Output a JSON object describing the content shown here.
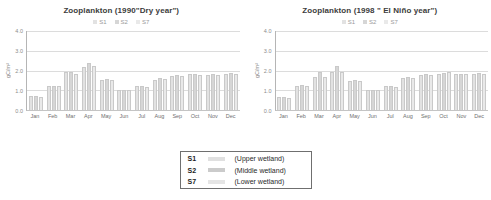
{
  "colors": {
    "grid": "#dcdcdc",
    "axis_line": "#b5b5b5",
    "baseline": "#c4c4c4",
    "title_text": "#3c3c3c",
    "axis_text": "#8c8c8c",
    "legend_text": "#9a9a9a",
    "bar_border": "#c9c9c9"
  },
  "chart_data": [
    {
      "type": "bar",
      "title": "Zooplankton (1990\"Dry year\")",
      "ylabel": "gC/m²",
      "ylim": [
        0.0,
        4.0
      ],
      "yticks": [
        "4.0",
        "3.0",
        "2.0",
        "1.0",
        "0.0"
      ],
      "grid": true,
      "legend_position": "top",
      "legend": [
        "S1",
        "S2",
        "S7"
      ],
      "categories": [
        "Jan",
        "Feb",
        "Mar",
        "Apr",
        "May",
        "Jun",
        "Jul",
        "Aug",
        "Sep",
        "Oct",
        "Nov",
        "Dec"
      ],
      "series": [
        {
          "name": "S1",
          "color": "#e2e2e2",
          "values": [
            0.7,
            1.2,
            1.9,
            2.2,
            1.5,
            1.0,
            1.2,
            1.5,
            1.7,
            1.8,
            1.75,
            1.8
          ]
        },
        {
          "name": "S2",
          "color": "#d6d6d6",
          "values": [
            0.7,
            1.2,
            1.9,
            2.4,
            1.55,
            1.0,
            1.2,
            1.6,
            1.75,
            1.8,
            1.8,
            1.85
          ]
        },
        {
          "name": "S7",
          "color": "#e9e9e9",
          "values": [
            0.65,
            1.2,
            1.8,
            2.25,
            1.5,
            1.0,
            1.15,
            1.55,
            1.7,
            1.75,
            1.75,
            1.8
          ]
        }
      ]
    },
    {
      "type": "bar",
      "title": "Zooplankton (1998 \" El Niño year\")",
      "ylabel": "gC/m²",
      "ylim": [
        0.0,
        4.0
      ],
      "yticks": [
        "4.0",
        "3.0",
        "2.0",
        "1.0",
        "0.0"
      ],
      "grid": true,
      "legend_position": "top",
      "legend": [
        "S1",
        "S2",
        "S7"
      ],
      "categories": [
        "Jan",
        "Feb",
        "Mar",
        "Apr",
        "May",
        "Jun",
        "Jul",
        "Aug",
        "Sep",
        "Oct",
        "Nov",
        "Dec"
      ],
      "series": [
        {
          "name": "S1",
          "color": "#e2e2e2",
          "values": [
            0.65,
            1.2,
            1.65,
            1.9,
            1.45,
            1.0,
            1.2,
            1.6,
            1.75,
            1.8,
            1.8,
            1.8
          ]
        },
        {
          "name": "S2",
          "color": "#d6d6d6",
          "values": [
            0.65,
            1.25,
            1.9,
            2.25,
            1.5,
            1.0,
            1.2,
            1.65,
            1.8,
            1.85,
            1.8,
            1.85
          ]
        },
        {
          "name": "S7",
          "color": "#e9e9e9",
          "values": [
            0.6,
            1.2,
            1.65,
            1.9,
            1.45,
            1.0,
            1.15,
            1.6,
            1.75,
            1.9,
            1.8,
            1.8
          ]
        }
      ]
    }
  ],
  "station_legend": {
    "rows": [
      {
        "code": "S1",
        "swatch": "#e0e0e0",
        "label": "(Upper wetland)"
      },
      {
        "code": "S2",
        "swatch": "#cbcbcb",
        "label": "(Middle wetland)"
      },
      {
        "code": "S7",
        "swatch": "#e5e5e5",
        "label": "(Lower wetland)"
      }
    ]
  }
}
